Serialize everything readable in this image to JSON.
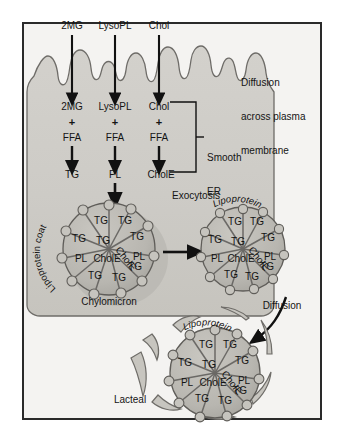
{
  "figure": {
    "frame": {
      "border_color": "#2a2a2a",
      "background": "#f4f3f1"
    }
  },
  "colors": {
    "cell_fill": "#cfcdc8",
    "cell_stroke": "#6e6c68",
    "chylomicron_fill": "#b9b7b1",
    "chylomicron_stroke": "#5f5d59",
    "lacteal_fill": "#c7c5bf",
    "arrow": "#111111",
    "text": "#141414"
  },
  "substrates": {
    "lumen_labels": [
      {
        "name": "2MG",
        "x": 72,
        "y": 27
      },
      {
        "name": "LysoPL",
        "x": 115,
        "y": 27
      },
      {
        "name": "Chol",
        "x": 159,
        "y": 27
      }
    ],
    "cytosol_labels": [
      {
        "name": "2MG",
        "x": 72,
        "y": 108
      },
      {
        "name": "LysoPL",
        "x": 115,
        "y": 108
      },
      {
        "name": "Chol",
        "x": 159,
        "y": 108
      }
    ],
    "plus_signs": [
      {
        "symbol": "+",
        "x": 72,
        "y": 123
      },
      {
        "symbol": "+",
        "x": 115,
        "y": 123
      },
      {
        "symbol": "+",
        "x": 159,
        "y": 123
      }
    ],
    "cofactor_labels": [
      {
        "name": "FFA",
        "x": 72,
        "y": 139
      },
      {
        "name": "FFA",
        "x": 115,
        "y": 139
      },
      {
        "name": "FFA",
        "x": 159,
        "y": 139
      }
    ],
    "product_labels": [
      {
        "name": "TG",
        "x": 72,
        "y": 176
      },
      {
        "name": "PL",
        "x": 115,
        "y": 176
      },
      {
        "name": "CholE",
        "x": 161,
        "y": 176
      }
    ]
  },
  "annotations": {
    "diffusion_membrane": {
      "lines": [
        "Diffusion",
        "across plasma",
        "membrane"
      ],
      "x": 241,
      "y": 62
    },
    "smooth_er": {
      "lines": [
        "Smooth",
        "ER"
      ],
      "x": 208,
      "y": 137
    },
    "exocytosis": {
      "label": "Exocytosis",
      "x": 192,
      "y": 196
    },
    "diffusion_lacteal": {
      "label": "Diffusion",
      "x": 278,
      "y": 305
    },
    "chylomicron_caption": {
      "label": "Chylomicron",
      "x": 109,
      "y": 289
    },
    "lacteal_caption": {
      "label": "Lacteal",
      "x": 118,
      "y": 400
    },
    "lipoprotein_coat": {
      "label": "Lipoprotein coat"
    },
    "lipoprotein_right": {
      "label": "Lipoprotein"
    },
    "lipoprotein_lacteal": {
      "label": "Lipoprotein"
    }
  },
  "particles": [
    {
      "id": "chylomicron-cell",
      "caption": "Chylomicron",
      "coat_label": "Lipoprotein coat",
      "cx": 109,
      "cy": 249,
      "r": 46,
      "core_labels": [
        {
          "text": "TG",
          "dx": -8,
          "dy": -28
        },
        {
          "text": "TG",
          "dx": 16,
          "dy": -28
        },
        {
          "text": "TG",
          "dx": -30,
          "dy": -10
        },
        {
          "text": "TG",
          "dx": -6,
          "dy": -8
        },
        {
          "text": "TG",
          "dx": 28,
          "dy": -12
        },
        {
          "text": "PL",
          "dx": -28,
          "dy": 10
        },
        {
          "text": "CholE",
          "dx": -5,
          "dy": 10
        },
        {
          "text": "PL",
          "dx": 30,
          "dy": 8
        },
        {
          "text": "TG",
          "dx": -14,
          "dy": 27
        },
        {
          "text": "TG",
          "dx": 10,
          "dy": 29
        },
        {
          "text": "TG",
          "dx": 26,
          "dy": 18
        },
        {
          "text": "CholE",
          "dx": 9,
          "dy": 3,
          "rotated": true
        }
      ]
    },
    {
      "id": "chylomicron-exocytosed",
      "coat_label": "Lipoprotein",
      "cx": 243,
      "cy": 249,
      "r": 42,
      "core_labels": [
        {
          "text": "TG",
          "dx": -8,
          "dy": -26
        },
        {
          "text": "TG",
          "dx": 14,
          "dy": -26
        },
        {
          "text": "TG",
          "dx": -28,
          "dy": -8
        },
        {
          "text": "TG",
          "dx": -5,
          "dy": -7
        },
        {
          "text": "TG",
          "dx": 25,
          "dy": -10
        },
        {
          "text": "PL",
          "dx": -26,
          "dy": 10
        },
        {
          "text": "CholE",
          "dx": -4,
          "dy": 10
        },
        {
          "text": "PL",
          "dx": 27,
          "dy": 8
        },
        {
          "text": "TG",
          "dx": -12,
          "dy": 25
        },
        {
          "text": "TG",
          "dx": 9,
          "dy": 27
        },
        {
          "text": "TG",
          "dx": 24,
          "dy": 17
        },
        {
          "text": "CholE",
          "dx": 8,
          "dy": 3,
          "rotated": true
        }
      ]
    },
    {
      "id": "chylomicron-lacteal",
      "coat_label": "Lipoprotein",
      "cx": 215,
      "cy": 373,
      "r": 45,
      "core_labels": [
        {
          "text": "TG",
          "dx": -9,
          "dy": -27
        },
        {
          "text": "TG",
          "dx": 15,
          "dy": -27
        },
        {
          "text": "TG",
          "dx": -30,
          "dy": -9
        },
        {
          "text": "TG",
          "dx": -6,
          "dy": -8
        },
        {
          "text": "TG",
          "dx": 27,
          "dy": -11
        },
        {
          "text": "PL",
          "dx": -28,
          "dy": 10
        },
        {
          "text": "CholE",
          "dx": -5,
          "dy": 10
        },
        {
          "text": "PL",
          "dx": 29,
          "dy": 8
        },
        {
          "text": "TG",
          "dx": -13,
          "dy": 26
        },
        {
          "text": "TG",
          "dx": 10,
          "dy": 28
        },
        {
          "text": "TG",
          "dx": 25,
          "dy": 18
        },
        {
          "text": "CholE",
          "dx": 9,
          "dy": 3,
          "rotated": true
        }
      ]
    }
  ]
}
